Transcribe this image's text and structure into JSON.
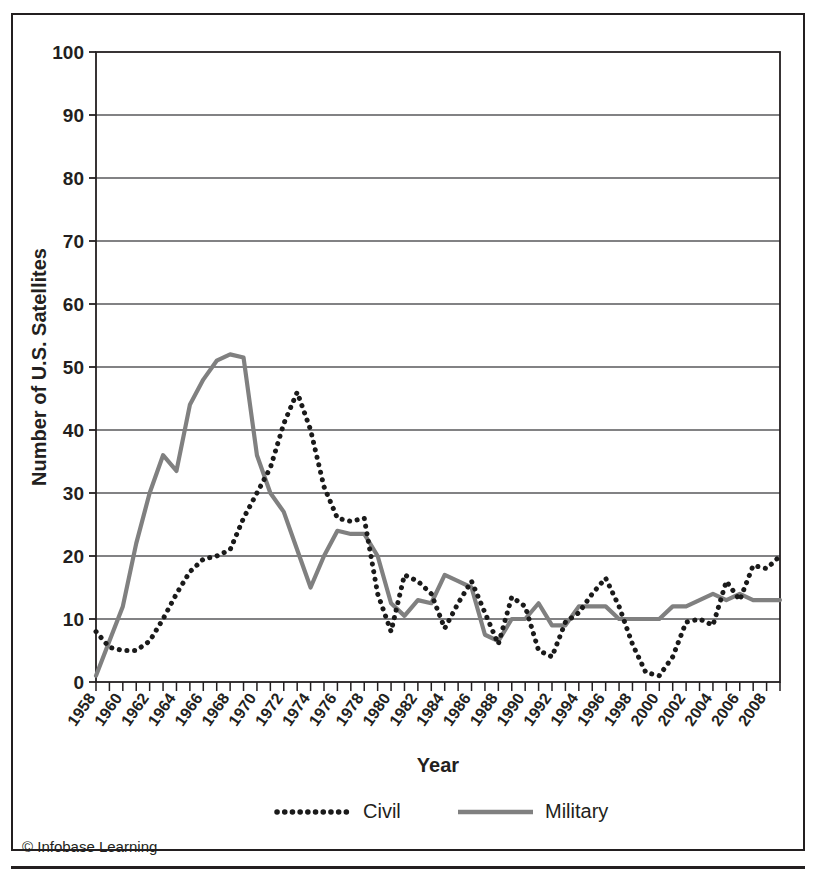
{
  "figure": {
    "credit": "© Infobase Learning"
  },
  "legend": {
    "position": "bottom-center",
    "entries": [
      {
        "label": "Civil",
        "style": "dotted",
        "color": "#1a1a1a"
      },
      {
        "label": "Military",
        "style": "solid",
        "color": "#808080"
      }
    ]
  },
  "chart_data": {
    "type": "line",
    "title": "",
    "xlabel": "Year",
    "ylabel": "Number of U.S. Satellites",
    "xlim": [
      1958,
      2009
    ],
    "ylim": [
      0,
      100
    ],
    "ytick_step": 10,
    "yticks": [
      0,
      10,
      20,
      30,
      40,
      50,
      60,
      70,
      80,
      90,
      100
    ],
    "grid": true,
    "grid_axis": "y",
    "xtick_labels_every": 2,
    "x": [
      1958,
      1959,
      1960,
      1961,
      1962,
      1963,
      1964,
      1965,
      1966,
      1967,
      1968,
      1969,
      1970,
      1971,
      1972,
      1973,
      1974,
      1975,
      1976,
      1977,
      1978,
      1979,
      1980,
      1981,
      1982,
      1983,
      1984,
      1985,
      1986,
      1987,
      1988,
      1989,
      1990,
      1991,
      1992,
      1993,
      1994,
      1995,
      1996,
      1997,
      1998,
      1999,
      2000,
      2001,
      2002,
      2003,
      2004,
      2005,
      2006,
      2007,
      2008,
      2009
    ],
    "xtick_labels": [
      "1958",
      "1960",
      "1962",
      "1964",
      "1966",
      "1968",
      "1970",
      "1972",
      "1974",
      "1976",
      "1978",
      "1980",
      "1982",
      "1984",
      "1986",
      "1988",
      "1990",
      "1992",
      "1994",
      "1996",
      "1998",
      "2000",
      "2002",
      "2004",
      "2006",
      "2008"
    ],
    "series": [
      {
        "name": "Civil",
        "style": "dotted",
        "color": "#1a1a1a",
        "values": [
          8,
          5,
          5,
          5,
          10,
          15,
          19,
          20,
          26,
          30,
          41,
          46,
          40,
          31,
          26,
          25,
          26,
          14,
          8,
          17,
          16,
          14,
          8,
          12,
          16,
          11,
          6,
          14,
          12,
          5,
          4,
          9,
          11,
          14,
          16,
          12,
          6,
          1,
          1,
          4,
          9,
          10,
          9,
          14,
          16,
          14,
          12,
          16,
          18,
          18,
          22,
          22
        ]
      },
      {
        "name": "Military",
        "style": "solid",
        "color": "#808080",
        "values": [
          1,
          6,
          12,
          22,
          30,
          36,
          34,
          44,
          48,
          52,
          52,
          51,
          36,
          30,
          27,
          20,
          15,
          20,
          24,
          23,
          23,
          20,
          12,
          10,
          13,
          12,
          17,
          16,
          15,
          7,
          6,
          10,
          10,
          12,
          9,
          9,
          12,
          12,
          12,
          10,
          10,
          10,
          10,
          12,
          12,
          13,
          14,
          13,
          14,
          13,
          13,
          13
        ]
      }
    ],
    "annotations": [
      {
        "text": "Civil peak 1968",
        "x": 1968,
        "y": 46
      },
      {
        "text": "Military peak 1967",
        "x": 1967,
        "y": 52
      },
      {
        "text": "Civil peak 1998",
        "x": 1998,
        "y": 88
      }
    ]
  },
  "civil_plot_points": [
    [
      1958,
      8
    ],
    [
      1959,
      5.5
    ],
    [
      1960,
      5
    ],
    [
      1961,
      5
    ],
    [
      1962,
      6
    ],
    [
      1963,
      10
    ],
    [
      1964,
      14
    ],
    [
      1965,
      17
    ],
    [
      1966,
      19
    ],
    [
      1967,
      20
    ],
    [
      1968,
      21
    ],
    [
      1969,
      26
    ],
    [
      1970,
      30
    ],
    [
      1971,
      34
    ],
    [
      1972,
      41
    ],
    [
      1973,
      46
    ],
    [
      1974,
      40
    ],
    [
      1975,
      31
    ],
    [
      1976,
      26
    ],
    [
      1977,
      25
    ],
    [
      1978,
      26
    ],
    [
      1979,
      14
    ],
    [
      1980,
      8
    ],
    [
      1981,
      17
    ],
    [
      1982,
      16
    ],
    [
      1983,
      14
    ],
    [
      1984,
      8
    ],
    [
      1985,
      12
    ],
    [
      1986,
      16
    ],
    [
      1987,
      11
    ],
    [
      1988,
      6
    ],
    [
      1989,
      14
    ],
    [
      1990,
      12
    ],
    [
      1991,
      5
    ],
    [
      1992,
      4
    ],
    [
      1993,
      9
    ],
    [
      1994,
      11
    ],
    [
      1995,
      14
    ],
    [
      1996,
      16
    ],
    [
      1997,
      12
    ],
    [
      1998,
      6
    ],
    [
      1999,
      1
    ],
    [
      2000,
      1
    ],
    [
      2001,
      4
    ],
    [
      2002,
      9
    ],
    [
      2003,
      10
    ],
    [
      2004,
      9
    ],
    [
      2005,
      14
    ],
    [
      2006,
      16
    ],
    [
      2007,
      14
    ],
    [
      2008,
      12
    ],
    [
      2009,
      16
    ]
  ],
  "civil_values_by_year": {
    "1958": 8,
    "1959": 5.5,
    "1960": 5,
    "1961": 5,
    "1962": 6.5,
    "1963": 10,
    "1964": 14,
    "1965": 17.5,
    "1966": 19.5,
    "1967": 20,
    "1968": 21,
    "1969": 26,
    "1970": 30,
    "1971": 34,
    "1972": 41,
    "1973": 46,
    "1974": 40,
    "1975": 31,
    "1976": 26,
    "1977": 25.5,
    "1978": 26,
    "1979": 14,
    "1980": 8,
    "1981": 17,
    "1982": 16,
    "1983": 14,
    "1984": 8.5,
    "1985": 12.5,
    "1986": 16,
    "1987": 11,
    "1988": 6,
    "1989": 13.5,
    "1990": 12,
    "1991": 5,
    "1992": 4,
    "1993": 9.5,
    "1994": 11,
    "1995": 14,
    "1996": 16.5,
    "1997": 12,
    "1998": 6,
    "1999": 1.5,
    "2000": 1,
    "2001": 4,
    "2002": 9.5,
    "2003": 10,
    "2004": 9,
    "2005": 16,
    "2006": 13,
    "2007": 18.5,
    "2008": 18,
    "2009": 20
  },
  "civil_full_series": [
    8,
    5.5,
    5,
    5,
    6.5,
    10,
    14,
    17.5,
    19.5,
    20,
    21,
    26,
    30,
    34,
    41,
    46,
    40,
    31,
    26,
    25.5,
    26,
    14,
    8,
    17,
    16,
    14,
    8.5,
    12.5,
    16,
    11,
    6,
    13.5,
    12,
    5,
    4,
    9.5,
    11,
    14,
    16.5,
    12,
    6,
    1.5,
    1,
    4,
    9.5,
    10,
    9,
    16,
    13,
    18.5,
    18,
    20
  ],
  "military_full_series": [
    1,
    6.5,
    12,
    22,
    30,
    36,
    33.5,
    44,
    48,
    51,
    52,
    51.5,
    36,
    30,
    27,
    21,
    15,
    20,
    24,
    23.5,
    23.5,
    20,
    12.5,
    10.5,
    13,
    12.5,
    17,
    16,
    15,
    7.5,
    6.5,
    10,
    10,
    12.5,
    9,
    9,
    12,
    12,
    12,
    10,
    10,
    10,
    10,
    12,
    12,
    13,
    14,
    13,
    14,
    13,
    13,
    13
  ]
}
